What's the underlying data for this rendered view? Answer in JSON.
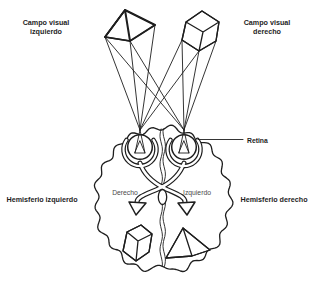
{
  "figure": {
    "colors": {
      "ink": "#1e1e1e",
      "background": "#ffffff",
      "inner_label": "#4a4a4a"
    },
    "labels": {
      "left_visual_field": {
        "line1": "Campo visual",
        "line2": "izquierdo"
      },
      "right_visual_field": {
        "line1": "Campo visual",
        "line2": "derecho"
      },
      "left_hemisphere": "Hemisferio izquierdo",
      "right_hemisphere": "Hemisferio derecho",
      "retina": "Retina",
      "brain_left_field_label": "Derecho",
      "brain_right_field_label": "Izquierdo"
    }
  }
}
